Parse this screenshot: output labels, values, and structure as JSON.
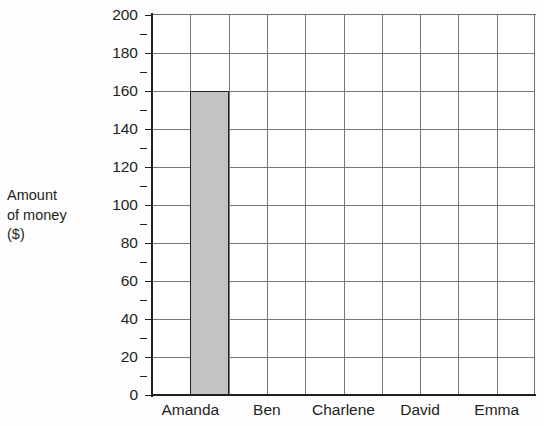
{
  "chart_data": {
    "type": "bar",
    "title": "",
    "subtitle": "",
    "categories": [
      "Amanda",
      "Ben",
      "Charlene",
      "David",
      "Emma"
    ],
    "values": [
      160,
      0,
      0,
      0,
      0
    ],
    "xlabel": "",
    "ylabel": "Amount\nof money\n($)",
    "ylabel_lines": [
      "Amount",
      "of money",
      "($)"
    ],
    "ylim": [
      0,
      200
    ],
    "y_major_step": 20,
    "y_minor_step": 10,
    "y_tick_labels": [
      "0",
      "20",
      "40",
      "60",
      "80",
      "100",
      "120",
      "140",
      "160",
      "180",
      "200"
    ],
    "y_tick_values": [
      0,
      20,
      40,
      60,
      80,
      100,
      120,
      140,
      160,
      180,
      200
    ],
    "grid": true,
    "grid_columns": 10,
    "legend": "none",
    "bar_fill_color": "#c3c3c3",
    "bar_border_color": "#231f20",
    "grid_color": "#77787b",
    "axis_color": "#231f20",
    "background_color": "#ffffff",
    "page_background_color": "#fdfdfd",
    "text_color": "#231f20"
  }
}
